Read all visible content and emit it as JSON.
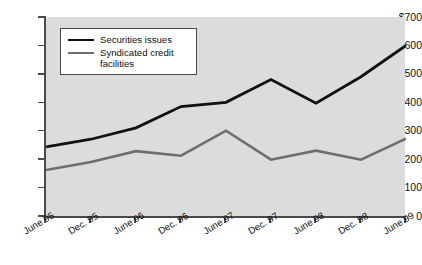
{
  "chart_data": {
    "type": "line",
    "title": "",
    "xlabel": "",
    "ylabel": "",
    "y_axis_prefix": "$",
    "categories": [
      "June 95",
      "Dec. 95",
      "June 96",
      "Dec. 96",
      "June 97",
      "Dec. 97",
      "June 98",
      "Dec. 98",
      "June 99"
    ],
    "yticks": [
      "0",
      "100",
      "200",
      "300",
      "400",
      "500",
      "600",
      "$700"
    ],
    "ytick_values": [
      0,
      100,
      200,
      300,
      400,
      500,
      600,
      700
    ],
    "ylim": [
      0,
      700
    ],
    "grid": false,
    "legend_position": "upper-left-inside",
    "series": [
      {
        "name": "Securities issues",
        "color": "#111111",
        "values": [
          243,
          270,
          310,
          385,
          400,
          480,
          397,
          490,
          600
        ]
      },
      {
        "name": "Syndicated credit facilities",
        "color": "#6e6e6e",
        "values": [
          162,
          190,
          228,
          212,
          300,
          198,
          230,
          198,
          272
        ]
      }
    ]
  },
  "legend": {
    "items": [
      {
        "label": "Securities issues",
        "color": "#111111"
      },
      {
        "label": "Syndicated credit facilities",
        "color": "#6e6e6e"
      }
    ]
  },
  "colors": {
    "plot_background": "#dcdcdc",
    "page_background": "#ffffff",
    "axis": "#4a4a4a",
    "series_black": "#111111",
    "series_gray": "#6e6e6e"
  }
}
